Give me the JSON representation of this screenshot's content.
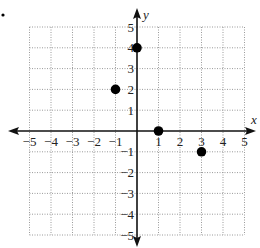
{
  "figure": {
    "bullet_marker": "•",
    "x_axis": {
      "name": "x",
      "min": -5,
      "max": 5,
      "tick_labels": [
        "−5",
        "−4",
        "−3",
        "−2",
        "−1",
        "1",
        "2",
        "3",
        "4",
        "5"
      ]
    },
    "y_axis": {
      "name": "y",
      "min": -5,
      "max": 5,
      "tick_labels": [
        "5",
        "4",
        "3",
        "2",
        "1",
        "−1",
        "−2",
        "−3",
        "−4",
        "−5"
      ]
    },
    "grid": "dotted",
    "points": [
      {
        "x": 0,
        "y": 4
      },
      {
        "x": -1,
        "y": 2
      },
      {
        "x": 1,
        "y": 0
      },
      {
        "x": 3,
        "y": -1
      }
    ],
    "colors": {
      "axis": "#111111",
      "grid": "#9a9a9a",
      "point": "#000000"
    }
  },
  "chart_data": {
    "type": "scatter",
    "title": "",
    "xlabel": "x",
    "ylabel": "y",
    "xlim": [
      -5,
      5
    ],
    "ylim": [
      -5,
      5
    ],
    "grid": true,
    "x": [
      0,
      -1,
      1,
      3
    ],
    "y": [
      4,
      2,
      0,
      -1
    ],
    "series": [
      {
        "name": "points",
        "x": [
          0,
          -1,
          1,
          3
        ],
        "y": [
          4,
          2,
          0,
          -1
        ]
      }
    ]
  }
}
